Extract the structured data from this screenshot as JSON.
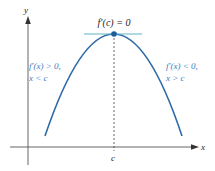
{
  "diagram": {
    "title_label": "f′(c) = 0",
    "axes": {
      "x_label": "x",
      "y_label": "y"
    },
    "tick_label": "c",
    "left_annotation": {
      "line1": "f′(x) > 0,",
      "line2": "x < c"
    },
    "right_annotation": {
      "line1": "f′(x) < 0,",
      "line2": "x > c"
    },
    "colors": {
      "curve": "#2e6aa8",
      "tangent": "#5fb3c9",
      "point": "#1f5d99",
      "annotation_text": "#3a7cc0",
      "axis": "#555555",
      "dashed": "#444444",
      "text": "#222222"
    }
  }
}
